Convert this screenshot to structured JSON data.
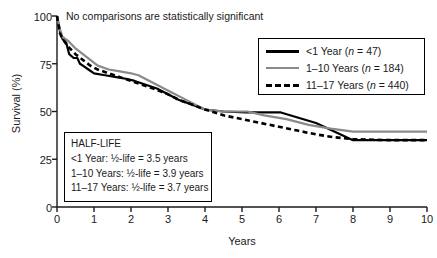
{
  "figure": {
    "annotation": "No comparisons are statistically significant",
    "xlabel": "Years",
    "ylabel": "Survival (%)"
  },
  "axes": {
    "yticks": [
      "0",
      "25",
      "50",
      "75",
      "100"
    ],
    "xticks": [
      "0",
      "1",
      "2",
      "3",
      "4",
      "5",
      "6",
      "7",
      "8",
      "9",
      "10"
    ]
  },
  "legend": {
    "items": [
      {
        "label_main": "<1 Year (",
        "n_italic": "n",
        "n_value": " = 47)",
        "style": "solid-black",
        "color": "#000000"
      },
      {
        "label_main": "1–10 Years (",
        "n_italic": "n",
        "n_value": " = 184)",
        "style": "solid-gray",
        "color": "#8a8a8a"
      },
      {
        "label_main": "11–17 Years (",
        "n_italic": "n",
        "n_value": " = 440)",
        "style": "dashed-black",
        "color": "#000000"
      }
    ]
  },
  "halflife_box": {
    "title": "HALF-LIFE",
    "lines": [
      "<1 Year: ½-life = 3.5 years",
      "1–10 Years: ½-life = 3.9 years",
      "11–17 Years: ½-life = 3.7 years"
    ]
  },
  "chart_data": {
    "type": "line",
    "title": "",
    "subtitle": "No comparisons are statistically significant",
    "xlabel": "Years",
    "ylabel": "Survival (%)",
    "xlim": [
      0,
      10
    ],
    "ylim": [
      0,
      100
    ],
    "xticks": [
      0,
      1,
      2,
      3,
      4,
      5,
      6,
      7,
      8,
      9,
      10
    ],
    "yticks": [
      0,
      25,
      50,
      75,
      100
    ],
    "grid": false,
    "legend_position": "top-right",
    "annotations": [
      {
        "text": "No comparisons are statistically significant",
        "x": 0.25,
        "y": 98
      },
      {
        "text": "HALF-LIFE: <1 Year = 3.5 years; 1–10 Years = 3.9 years; 11–17 Years = 3.7 years",
        "x": 0.3,
        "y": 30
      }
    ],
    "series": [
      {
        "name": "<1 Year (n = 47)",
        "n": 47,
        "half_life_years": 3.5,
        "style": "solid",
        "color": "#000000",
        "points": [
          [
            0.0,
            100
          ],
          [
            0.08,
            92
          ],
          [
            0.15,
            88
          ],
          [
            0.25,
            86
          ],
          [
            0.33,
            80
          ],
          [
            0.45,
            78
          ],
          [
            0.55,
            78
          ],
          [
            0.62,
            75
          ],
          [
            0.7,
            74
          ],
          [
            0.85,
            72
          ],
          [
            1.0,
            70
          ],
          [
            1.3,
            69
          ],
          [
            1.6,
            68
          ],
          [
            1.9,
            67
          ],
          [
            2.1,
            66
          ],
          [
            2.4,
            64
          ],
          [
            2.7,
            62
          ],
          [
            3.0,
            59
          ],
          [
            3.3,
            56
          ],
          [
            3.6,
            54
          ],
          [
            4.0,
            51
          ],
          [
            4.5,
            50
          ],
          [
            5.1,
            49.5
          ],
          [
            6.05,
            49.5
          ],
          [
            7.0,
            44
          ],
          [
            8.0,
            35
          ],
          [
            10.0,
            35
          ]
        ]
      },
      {
        "name": "1–10 Years (n = 184)",
        "n": 184,
        "half_life_years": 3.9,
        "style": "solid",
        "color": "#8a8a8a",
        "points": [
          [
            0.0,
            100
          ],
          [
            0.08,
            93
          ],
          [
            0.15,
            89
          ],
          [
            0.3,
            87
          ],
          [
            0.5,
            83
          ],
          [
            0.7,
            80
          ],
          [
            0.9,
            77
          ],
          [
            1.1,
            74
          ],
          [
            1.4,
            72
          ],
          [
            1.7,
            71
          ],
          [
            2.0,
            70
          ],
          [
            2.2,
            69
          ],
          [
            2.5,
            66
          ],
          [
            2.8,
            63
          ],
          [
            3.1,
            60
          ],
          [
            3.4,
            57
          ],
          [
            3.7,
            54
          ],
          [
            4.0,
            51
          ],
          [
            4.5,
            50
          ],
          [
            5.15,
            50
          ],
          [
            5.6,
            48
          ],
          [
            6.2,
            46
          ],
          [
            6.8,
            43
          ],
          [
            7.4,
            41
          ],
          [
            8.0,
            39.5
          ],
          [
            10.0,
            39.5
          ]
        ]
      },
      {
        "name": "11–17 Years (n = 440)",
        "n": 440,
        "half_life_years": 3.7,
        "style": "dashed",
        "color": "#000000",
        "points": [
          [
            0.0,
            100
          ],
          [
            0.08,
            91
          ],
          [
            0.15,
            88
          ],
          [
            0.3,
            84
          ],
          [
            0.5,
            80
          ],
          [
            0.7,
            77
          ],
          [
            0.9,
            74
          ],
          [
            1.1,
            72
          ],
          [
            1.4,
            70
          ],
          [
            1.7,
            68
          ],
          [
            2.0,
            66
          ],
          [
            2.3,
            64
          ],
          [
            2.6,
            62
          ],
          [
            3.0,
            59
          ],
          [
            3.3,
            56
          ],
          [
            3.6,
            54
          ],
          [
            4.0,
            51
          ],
          [
            4.5,
            48
          ],
          [
            5.0,
            46
          ],
          [
            5.5,
            44
          ],
          [
            6.0,
            42
          ],
          [
            6.5,
            40
          ],
          [
            7.0,
            38
          ],
          [
            7.5,
            36.5
          ],
          [
            8.0,
            35.5
          ],
          [
            9.0,
            35
          ],
          [
            10.0,
            35
          ]
        ]
      }
    ]
  }
}
